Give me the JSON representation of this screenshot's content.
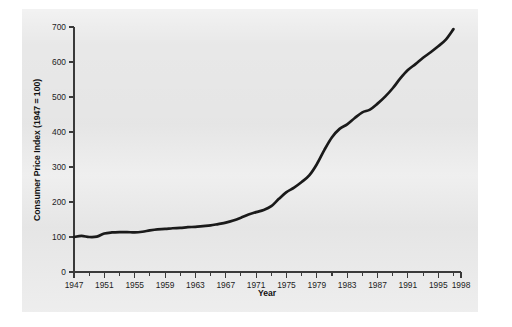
{
  "chart_data": {
    "type": "line",
    "title": "",
    "xlabel": "Year",
    "ylabel": "Consumer Price Index (1947 = 100)",
    "xlim": [
      1947,
      1998
    ],
    "ylim": [
      0,
      700
    ],
    "grid": false,
    "legend": "none",
    "x_tick_labels": [
      "1947",
      "1951",
      "1955",
      "1959",
      "1963",
      "1967",
      "1971",
      "1975",
      "1979",
      "1983",
      "1987",
      "1991",
      "1995",
      "1998"
    ],
    "x_tick_values": [
      1947,
      1951,
      1955,
      1959,
      1963,
      1967,
      1971,
      1975,
      1979,
      1983,
      1987,
      1991,
      1995,
      1998
    ],
    "x_minor_tick_values": [
      1949,
      1953,
      1957,
      1961,
      1965,
      1969,
      1973,
      1977,
      1981,
      1985,
      1989,
      1993,
      1997
    ],
    "y_tick_labels": [
      "0",
      "100",
      "200",
      "300",
      "400",
      "500",
      "600",
      "700"
    ],
    "y_tick_values": [
      0,
      100,
      200,
      300,
      400,
      500,
      600,
      700
    ],
    "series": [
      {
        "name": "Consumer Price Index",
        "color": "#1a1a1a",
        "x": [
          1947,
          1948,
          1949,
          1950,
          1951,
          1952,
          1953,
          1954,
          1955,
          1956,
          1957,
          1958,
          1959,
          1960,
          1961,
          1962,
          1963,
          1964,
          1965,
          1966,
          1967,
          1968,
          1969,
          1970,
          1971,
          1972,
          1973,
          1974,
          1975,
          1976,
          1977,
          1978,
          1979,
          1980,
          1981,
          1982,
          1983,
          1984,
          1985,
          1986,
          1987,
          1988,
          1989,
          1990,
          1991,
          1992,
          1993,
          1994,
          1995,
          1996,
          1997
        ],
        "values": [
          100,
          103,
          100,
          101,
          110,
          113,
          114,
          114,
          113,
          115,
          119,
          122,
          123,
          125,
          126,
          128,
          129,
          131,
          133,
          137,
          141,
          147,
          155,
          164,
          171,
          177,
          188,
          209,
          228,
          241,
          257,
          276,
          308,
          349,
          385,
          409,
          422,
          440,
          456,
          464,
          481,
          501,
          525,
          553,
          577,
          594,
          612,
          628,
          645,
          664,
          694
        ]
      }
    ]
  },
  "axis": {
    "x_title": "Year",
    "y_title": "Consumer Price Index (1947 = 100)"
  }
}
